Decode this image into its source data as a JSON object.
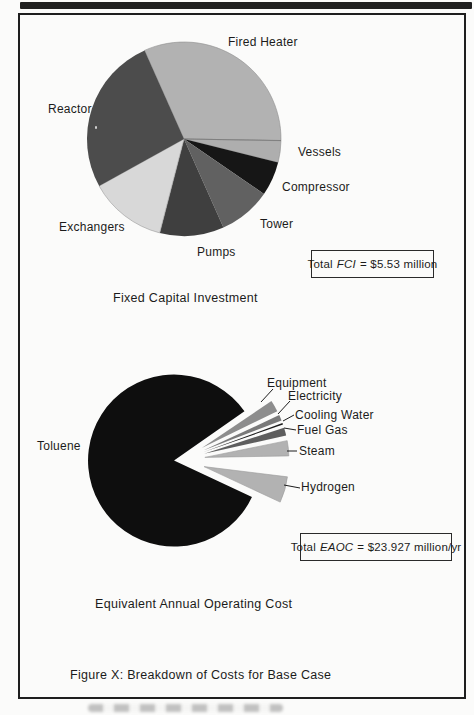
{
  "figure": {
    "caption": "Figure X: Breakdown of Costs for Base Case"
  },
  "fci_chart": {
    "title": "Fixed Capital Investment",
    "total_box": {
      "prefix": "Total",
      "italic_term": "FCI",
      "value_text": "= $5.53 million"
    }
  },
  "eaoc_chart": {
    "title": "Equivalent Annual Operating Cost",
    "total_box": {
      "prefix": "Total",
      "italic_term": "EAOC",
      "value_text": "= $23.927 million/yr"
    }
  },
  "chart_data": [
    {
      "type": "pie",
      "title": "Fixed Capital Investment",
      "total_label": "Total FCI = $5.53 million",
      "total_value_million_usd": 5.53,
      "categories": [
        "Fired Heater",
        "Vessels",
        "Compressor",
        "Tower",
        "Pumps",
        "Exchangers",
        "Reactor"
      ],
      "values_percent": [
        31.9,
        3.6,
        5.7,
        8.8,
        10.7,
        12.9,
        26.4
      ],
      "legend_position": "none",
      "render": {
        "cx": 184,
        "cy": 139,
        "r": 97,
        "slices": [
          {
            "id": "fired-heater",
            "label": "Fired Heater",
            "a0": -1,
            "a1": 114,
            "color": "#b2b2b2",
            "stroke": "#8f8f8f",
            "lx": 228,
            "ly": 36
          },
          {
            "id": "vessels",
            "label": "Vessels",
            "a0": -14,
            "a1": -1,
            "color": "#aeaeae",
            "stroke": "#8f8f8f",
            "lx": 298,
            "ly": 146
          },
          {
            "id": "compressor",
            "label": "Compressor",
            "a0": -34.5,
            "a1": -14,
            "color": "#161616",
            "lx": 282,
            "ly": 181
          },
          {
            "id": "tower",
            "label": "Tower",
            "a0": -66,
            "a1": -34.5,
            "color": "#616161",
            "lx": 260,
            "ly": 218
          },
          {
            "id": "pumps",
            "label": "Pumps",
            "a0": -104.5,
            "a1": -66,
            "color": "#3f3f3f",
            "lx": 197,
            "ly": 246
          },
          {
            "id": "exchangers",
            "label": "Exchangers",
            "a0": -151,
            "a1": -104.5,
            "color": "#d8d8d8",
            "stroke": "#9a9a9a",
            "lx": 59,
            "ly": 221
          },
          {
            "id": "reactor",
            "label": "Reactor",
            "a0": -246,
            "a1": -151,
            "color": "#4c4c4c",
            "lx": 48,
            "ly": 103
          }
        ],
        "lines": [
          {
            "x1": 184,
            "y1": 139,
            "x2": 281,
            "y2": 140.5,
            "color": "#777777",
            "w": 0.8
          }
        ]
      }
    },
    {
      "type": "pie",
      "title": "Equivalent Annual Operating Cost",
      "total_label": "Total EAOC = $23.927 million/yr",
      "total_value_million_usd_per_yr": 23.927,
      "categories": [
        "Toluene",
        "Equipment",
        "Electricity",
        "Cooling Water",
        "Fuel Gas",
        "Steam",
        "Hydrogen"
      ],
      "values_percent": [
        86.4,
        2.3,
        1.2,
        0.3,
        1.6,
        3.0,
        5.2
      ],
      "legend_position": "none",
      "render": {
        "cx": 181,
        "cy": 460,
        "r": 84,
        "slices": [
          {
            "id": "toluene",
            "label": "Toluene",
            "a0": 35,
            "a1": 335,
            "r": 86,
            "explode": 7,
            "color": "#0e0e0e",
            "lx": 37,
            "ly": 440
          },
          {
            "id": "equipment",
            "label": "Equipment",
            "a0": 26,
            "a1": 34,
            "explode": 24,
            "color": "#8d8d8d",
            "lx": 267,
            "ly": 377
          },
          {
            "id": "electricity",
            "label": "Electricity",
            "a0": 21,
            "a1": 25,
            "explode": 24,
            "color": "#7a7a7a",
            "lx": 288,
            "ly": 390
          },
          {
            "id": "cooling-water",
            "label": "Cooling Water",
            "a0": 19,
            "a1": 20.2,
            "explode": 24,
            "color": "#1d1d1d",
            "lx": 295,
            "ly": 409
          },
          {
            "id": "fuel-gas",
            "label": "Fuel Gas",
            "a0": 12.5,
            "a1": 18,
            "explode": 24,
            "color": "#5e5e5e",
            "lx": 297,
            "ly": 424
          },
          {
            "id": "steam",
            "label": "Steam",
            "a0": 1,
            "a1": 11.5,
            "explode": 24,
            "color": "#b2b2b2",
            "stroke": "#9a9a9a",
            "lx": 299,
            "ly": 445
          },
          {
            "id": "hydrogen",
            "label": "Hydrogen",
            "a0": -25,
            "a1": -7,
            "explode": 24,
            "color": "#b2b2b2",
            "stroke": "#9a9a9a",
            "lx": 301,
            "ly": 481
          }
        ],
        "lines": [
          {
            "x1": 273,
            "y1": 389,
            "x2": 261,
            "y2": 402,
            "color": "#1d1d1d",
            "w": 1
          },
          {
            "x1": 290,
            "y1": 401,
            "x2": 278,
            "y2": 414,
            "color": "#1d1d1d",
            "w": 1
          },
          {
            "x1": 294,
            "y1": 415,
            "x2": 283,
            "y2": 421,
            "color": "#1d1d1d",
            "w": 1
          },
          {
            "x1": 296,
            "y1": 430,
            "x2": 284,
            "y2": 428,
            "color": "#1d1d1d",
            "w": 1
          },
          {
            "x1": 297,
            "y1": 451,
            "x2": 287,
            "y2": 451,
            "color": "#1d1d1d",
            "w": 1
          },
          {
            "x1": 300,
            "y1": 488,
            "x2": 284,
            "y2": 485,
            "color": "#1d1d1d",
            "w": 1
          }
        ]
      }
    }
  ]
}
